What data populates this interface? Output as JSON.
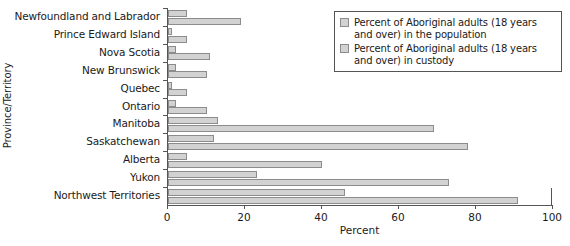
{
  "chart_data": {
    "type": "bar",
    "orientation": "horizontal",
    "title": "",
    "xlabel": "Percent",
    "ylabel": "Province/Territory",
    "xlim": [
      0,
      100
    ],
    "xticks": [
      0,
      20,
      40,
      60,
      80,
      100
    ],
    "grid": false,
    "legend_position": "top-right",
    "categories": [
      "Newfoundland and Labrador",
      "Prince Edward Island",
      "Nova Scotia",
      "New Brunswick",
      "Quebec",
      "Ontario",
      "Manitoba",
      "Saskatchewan",
      "Alberta",
      "Yukon",
      "Northwest Territories"
    ],
    "series": [
      {
        "name": "Percent of Aboriginal adults (18 years and over) in the population",
        "values": [
          5,
          1,
          2,
          2,
          1,
          2,
          13,
          12,
          5,
          23,
          46
        ]
      },
      {
        "name": "Percent of Aboriginal adults (18 years and over) in custody",
        "values": [
          19,
          5,
          11,
          10,
          5,
          10,
          69,
          78,
          40,
          73,
          91
        ]
      }
    ]
  },
  "legend": {
    "entries": [
      "Percent of Aboriginal adults (18 years and over) in the population",
      "Percent of Aboriginal adults (18 years and over) in custody"
    ]
  },
  "colors": {
    "bar_fill": "#d2d2d2",
    "bar_border": "#8c8c8c",
    "axis": "#555555",
    "text": "#1a1a1a"
  }
}
